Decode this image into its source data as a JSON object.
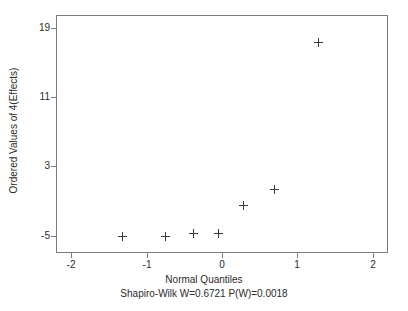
{
  "chart_data": {
    "type": "scatter",
    "title": "",
    "subtitle": "Shapiro-Wilk W=0.6721  P(W)=0.0018",
    "xlabel": "Normal Quantiles",
    "ylabel": "Ordered Values of 4(Effects)",
    "xlim": [
      -2.2,
      2.2
    ],
    "ylim": [
      -7.0,
      20.5
    ],
    "grid": false,
    "legend": null,
    "marker": "plus",
    "marker_color": "#3a3a3e",
    "frame_color": "#7c7c80",
    "background": "#ffffff",
    "xticks": [
      {
        "value": -2,
        "label": "-2"
      },
      {
        "value": -1,
        "label": "-1"
      },
      {
        "value": 0,
        "label": "0"
      },
      {
        "value": 1,
        "label": "1"
      },
      {
        "value": 2,
        "label": "2"
      }
    ],
    "yticks": [
      {
        "value": 19,
        "label": "19"
      },
      {
        "value": 11,
        "label": "11"
      },
      {
        "value": 3,
        "label": "3"
      },
      {
        "value": -5,
        "label": "-5"
      }
    ],
    "points": [
      {
        "x": -1.32,
        "y": -5.1
      },
      {
        "x": -0.75,
        "y": -5.1
      },
      {
        "x": -0.38,
        "y": -4.8
      },
      {
        "x": -0.05,
        "y": -4.8
      },
      {
        "x": 0.28,
        "y": -1.5
      },
      {
        "x": 0.69,
        "y": 0.3
      },
      {
        "x": 1.28,
        "y": 17.3
      }
    ],
    "stats": {
      "shapiro_wilk_W": 0.6721,
      "p_value": 0.0018
    }
  }
}
